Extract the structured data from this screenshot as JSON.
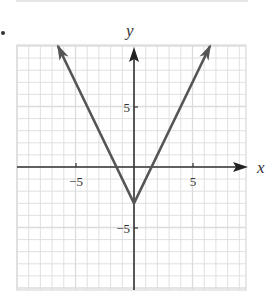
{
  "chart_data": {
    "type": "line",
    "title": "",
    "function": "y = 2|x| - 3",
    "xlabel": "x",
    "ylabel": "y",
    "xlim": [
      -10,
      10
    ],
    "ylim": [
      -10,
      10
    ],
    "grid": true,
    "grid_step": 1,
    "x_ticks": [
      {
        "value": -5,
        "label": "−5"
      },
      {
        "value": 5,
        "label": "5"
      }
    ],
    "y_ticks": [
      {
        "value": 5,
        "label": "5"
      },
      {
        "value": -5,
        "label": "−5"
      }
    ],
    "series": [
      {
        "name": "y = 2|x| - 3",
        "x": [
          -6.5,
          0,
          6.5
        ],
        "values": [
          10,
          -3,
          10
        ],
        "arrows_at_ends": true,
        "color": "#555555"
      }
    ],
    "vertex": {
      "x": 0,
      "y": -3
    },
    "legend": null
  },
  "labels": {
    "x_axis": "x",
    "y_axis": "y",
    "x_tick_neg5": "−5",
    "x_tick_5": "5",
    "y_tick_5": "5",
    "y_tick_neg5": "−5"
  },
  "colors": {
    "grid": "#dcdcdc",
    "axis": "#333333",
    "curve": "#555555"
  }
}
